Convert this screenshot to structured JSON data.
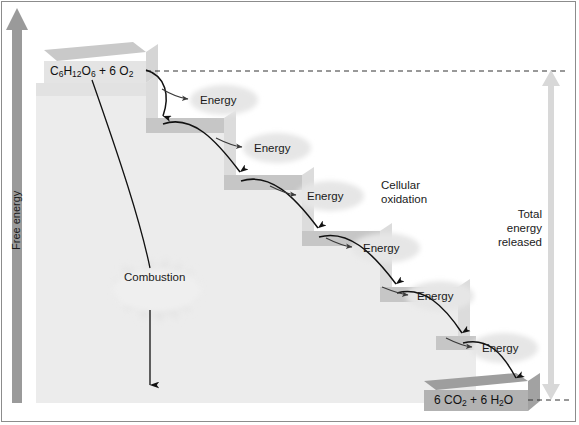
{
  "figure": {
    "axis": {
      "label": "Free energy",
      "arrow_icon": "up-arrow-icon"
    },
    "reactants": {
      "formula_plain": "C6H12O6 + 6 O2",
      "parts": [
        {
          "text": "C",
          "sub": false
        },
        {
          "text": "6",
          "sub": true
        },
        {
          "text": "H",
          "sub": false
        },
        {
          "text": "12",
          "sub": true
        },
        {
          "text": "O",
          "sub": false
        },
        {
          "text": "6",
          "sub": true
        },
        {
          "text": " + 6 O",
          "sub": false
        },
        {
          "text": "2",
          "sub": true
        }
      ]
    },
    "products": {
      "formula_plain": "6 CO2 + 6 H2O",
      "parts": [
        {
          "text": "6 CO",
          "sub": false
        },
        {
          "text": "2",
          "sub": true
        },
        {
          "text": " + 6 H",
          "sub": false
        },
        {
          "text": "2",
          "sub": true
        },
        {
          "text": "O",
          "sub": false
        }
      ]
    },
    "pathway_label": {
      "line1": "Cellular",
      "line2": "oxidation"
    },
    "total_energy_label": {
      "line1": "Total",
      "line2": "energy",
      "line3": "released"
    },
    "combustion_label": "Combustion",
    "energy_labels": [
      "Energy",
      "Energy",
      "Energy",
      "Energy",
      "Energy"
    ],
    "colors": {
      "background": "#ffffff",
      "frame": "#8c8c8c",
      "axis_arrow": "#9a9a9a",
      "step_top_face": "#c9c9c9",
      "step_front_face": "#ececec",
      "step_shadow": "#f0f0f0",
      "top_block_top": "#c9c9c9",
      "top_block_front": "#e6e6e6",
      "bottom_block_top": "#9e9e9e",
      "bottom_block_front": "#b0b0b0",
      "arrow_stroke": "#111111",
      "dashed_line": "#333333",
      "total_arrow": "#d8d8d8",
      "burst_glow": "#e2e2e2",
      "text": "#1a1a1a"
    }
  },
  "chart_data": {
    "type": "diagram",
    "ylabel": "Free energy",
    "levels": [
      {
        "name": "C6H12O6 + 6 O2",
        "step": 0,
        "relative_free_energy": 1.0
      },
      {
        "name": "intermediate 1",
        "step": 1,
        "relative_free_energy": 0.82
      },
      {
        "name": "intermediate 2",
        "step": 2,
        "relative_free_energy": 0.64
      },
      {
        "name": "intermediate 3",
        "step": 3,
        "relative_free_energy": 0.46
      },
      {
        "name": "intermediate 4",
        "step": 4,
        "relative_free_energy": 0.28
      },
      {
        "name": "intermediate 5",
        "step": 5,
        "relative_free_energy": 0.12
      },
      {
        "name": "6 CO2 + 6 H2O",
        "step": 6,
        "relative_free_energy": 0.0
      }
    ],
    "energy_releases": 5,
    "annotations": [
      "Cellular oxidation",
      "Combustion",
      "Total energy released"
    ]
  }
}
